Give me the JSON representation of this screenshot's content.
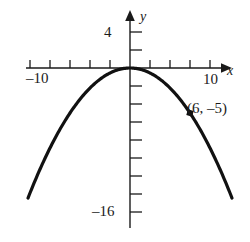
{
  "figure": {
    "name": "parabola-graph",
    "background_color": "#ffffff",
    "ink_color": "#1a1a1a"
  },
  "axes": {
    "x_axis_name": "x",
    "y_axis_name": "y",
    "x_tick_label_left": "–10",
    "x_tick_label_right": "10",
    "y_tick_label_top": "4",
    "y_tick_label_bottom": "–16"
  },
  "annotation": {
    "point_label": "(6, –5)"
  },
  "chart_data": {
    "type": "line",
    "title": "",
    "xlabel": "x",
    "ylabel": "y",
    "grid": false,
    "legend": false,
    "xlim": [
      -11.5,
      11.0
    ],
    "ylim": [
      -18.0,
      5.0
    ],
    "x_ticks": [
      -10,
      -8,
      -6,
      -4,
      -2,
      2,
      4,
      6,
      8,
      10
    ],
    "x_tick_labels": [
      "–10",
      "",
      "",
      "",
      "",
      "",
      "",
      "",
      "",
      "10"
    ],
    "y_ticks": [
      4,
      2,
      -2,
      -4,
      -6,
      -8,
      -10,
      -12,
      -14,
      -16
    ],
    "y_tick_labels": [
      "4",
      "",
      "",
      "",
      "",
      "",
      "",
      "",
      "",
      "–16"
    ],
    "equation": "y = -5x^2/36",
    "vertex": [
      0,
      0
    ],
    "series": [
      {
        "name": "parabola",
        "x": [
          -10,
          -9,
          -8,
          -7,
          -6,
          -5,
          -4,
          -3,
          -2,
          -1,
          0,
          1,
          2,
          3,
          4,
          5,
          6,
          7,
          8,
          9,
          10
        ],
        "values": [
          -13.9,
          -11.25,
          -8.9,
          -6.8,
          -5.0,
          -3.5,
          -2.2,
          -1.25,
          -0.6,
          -0.14,
          0,
          -0.14,
          -0.6,
          -1.25,
          -2.2,
          -3.5,
          -5.0,
          -6.8,
          -8.9,
          -11.25,
          -13.9
        ]
      }
    ],
    "points": [
      {
        "x": 6,
        "y": -5,
        "label": "(6, –5)"
      }
    ]
  }
}
